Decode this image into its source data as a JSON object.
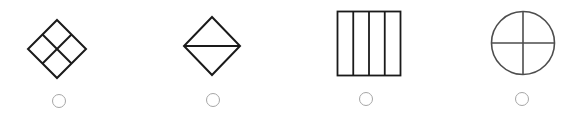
{
  "options": [
    {
      "id": "option-1",
      "shape": "diamond-2x2-grid",
      "description": "Diamond divided into four smaller diamonds",
      "radio": {
        "selected": false,
        "cx": 59,
        "cy": 101
      }
    },
    {
      "id": "option-2",
      "shape": "diamond-horizontal-diagonal",
      "description": "Diamond divided by a horizontal line into two triangles",
      "radio": {
        "selected": false,
        "cx": 213,
        "cy": 100
      }
    },
    {
      "id": "option-3",
      "shape": "square-four-columns",
      "description": "Square divided into four vertical strips",
      "radio": {
        "selected": false,
        "cx": 366,
        "cy": 99
      }
    },
    {
      "id": "option-4",
      "shape": "circle-quartered",
      "description": "Circle divided into four quarters by a cross",
      "radio": {
        "selected": false,
        "cx": 522,
        "cy": 99
      }
    }
  ],
  "colors": {
    "stroke": "#1a1a1a",
    "circle_stroke": "#4d4d4d",
    "radio_border": "#a6a6a6",
    "background": "#ffffff"
  }
}
